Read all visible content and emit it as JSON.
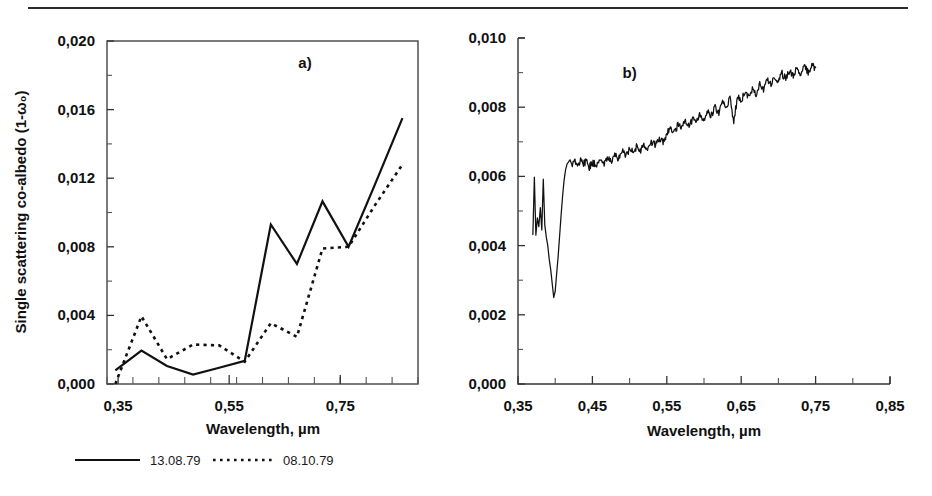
{
  "figure": {
    "panels": [
      "a)",
      "b)"
    ],
    "has_top_rule": true
  },
  "chart_data": [
    {
      "type": "line",
      "panel": "a)",
      "title": "",
      "xlabel": "Wavelength, µm",
      "ylabel": "Single scattering co-albedo (1-ω₀)",
      "xlim": [
        0.33,
        0.89
      ],
      "ylim": [
        0.0,
        0.02
      ],
      "xticks": [
        0.35,
        0.55,
        0.75
      ],
      "xticklabels": [
        "0,35",
        "0,55",
        "0,75"
      ],
      "xminor_step": 0.04667,
      "yticks": [
        0.0,
        0.004,
        0.008,
        0.012,
        0.016,
        0.02
      ],
      "yticklabels": [
        "0,000",
        "0,004",
        "0,008",
        "0,012",
        "0,016",
        "0,020"
      ],
      "yminor_step": 0.002,
      "grid": false,
      "legend_position": "below-left",
      "series": [
        {
          "name": "13.08.79",
          "style": "solid",
          "x": [
            0.345,
            0.392,
            0.438,
            0.485,
            0.532,
            0.578,
            0.625,
            0.672,
            0.718,
            0.765,
            0.812,
            0.862
          ],
          "values": [
            0.0008,
            0.00195,
            0.00105,
            0.00055,
            0.00095,
            0.00135,
            0.0093,
            0.007,
            0.01065,
            0.008,
            0.0116,
            0.0155
          ]
        },
        {
          "name": "08.10.79",
          "style": "dotted",
          "x": [
            0.345,
            0.392,
            0.438,
            0.485,
            0.532,
            0.578,
            0.625,
            0.672,
            0.718,
            0.765,
            0.812,
            0.862
          ],
          "values": [
            0.0,
            0.00395,
            0.00145,
            0.0023,
            0.00225,
            0.0013,
            0.00355,
            0.00275,
            0.0079,
            0.008,
            0.0104,
            0.0128
          ]
        }
      ]
    },
    {
      "type": "line",
      "panel": "b)",
      "title": "",
      "xlabel": "Wavelength, µm",
      "ylabel": "",
      "xlim": [
        0.35,
        0.85
      ],
      "ylim": [
        0.0,
        0.01
      ],
      "xticks": [
        0.35,
        0.45,
        0.55,
        0.65,
        0.75,
        0.85
      ],
      "xticklabels": [
        "0,35",
        "0,45",
        "0,55",
        "0,65",
        "0,75",
        "0,85"
      ],
      "xminor_step": 0.05,
      "yticks": [
        0.0,
        0.002,
        0.004,
        0.006,
        0.008,
        0.01
      ],
      "yticklabels": [
        "0,000",
        "0,002",
        "0,004",
        "0,006",
        "0,008",
        "0,010"
      ],
      "yminor_step": 0.001,
      "grid": false,
      "legend_position": "none",
      "series": [
        {
          "name": "spectrum",
          "style": "solid",
          "x": [
            0.37,
            0.372,
            0.374,
            0.376,
            0.378,
            0.38,
            0.382,
            0.384,
            0.386,
            0.388,
            0.39,
            0.392,
            0.394,
            0.396,
            0.398,
            0.4,
            0.402,
            0.404,
            0.406,
            0.408,
            0.41,
            0.412,
            0.414,
            0.416,
            0.418,
            0.42,
            0.423,
            0.426,
            0.43,
            0.434,
            0.438,
            0.442,
            0.446,
            0.45,
            0.455,
            0.46,
            0.465,
            0.47,
            0.475,
            0.48,
            0.485,
            0.49,
            0.495,
            0.5,
            0.505,
            0.51,
            0.515,
            0.52,
            0.525,
            0.53,
            0.535,
            0.54,
            0.545,
            0.55,
            0.555,
            0.56,
            0.565,
            0.57,
            0.575,
            0.58,
            0.585,
            0.59,
            0.595,
            0.6,
            0.605,
            0.61,
            0.615,
            0.62,
            0.625,
            0.63,
            0.635,
            0.64,
            0.645,
            0.65,
            0.655,
            0.66,
            0.665,
            0.67,
            0.675,
            0.68,
            0.685,
            0.69,
            0.695,
            0.7,
            0.705,
            0.71,
            0.715,
            0.72,
            0.725,
            0.73,
            0.735,
            0.74,
            0.745,
            0.75
          ],
          "values": [
            0.00432,
            0.00598,
            0.0043,
            0.0048,
            0.00455,
            0.0051,
            0.00445,
            0.00592,
            0.0046,
            0.00425,
            0.004,
            0.0036,
            0.0033,
            0.0029,
            0.0025,
            0.00268,
            0.0032,
            0.0037,
            0.0043,
            0.0049,
            0.00545,
            0.0059,
            0.0062,
            0.00636,
            0.00642,
            0.00648,
            0.0063,
            0.00652,
            0.00628,
            0.00645,
            0.00632,
            0.0065,
            0.00628,
            0.0064,
            0.00634,
            0.00648,
            0.00636,
            0.00655,
            0.00642,
            0.00668,
            0.00652,
            0.00672,
            0.0066,
            0.0068,
            0.00668,
            0.00688,
            0.00675,
            0.00692,
            0.0068,
            0.007,
            0.0069,
            0.00712,
            0.00698,
            0.0072,
            0.00742,
            0.00726,
            0.00748,
            0.00735,
            0.0076,
            0.00745,
            0.0077,
            0.00758,
            0.0078,
            0.00765,
            0.00792,
            0.00775,
            0.008,
            0.00785,
            0.00812,
            0.00795,
            0.00826,
            0.00755,
            0.00832,
            0.00818,
            0.00845,
            0.00828,
            0.00856,
            0.0084,
            0.00868,
            0.00852,
            0.0088,
            0.00862,
            0.00888,
            0.0087,
            0.00898,
            0.0088,
            0.00905,
            0.00888,
            0.00912,
            0.00895,
            0.00918,
            0.00902,
            0.0092,
            0.00915
          ]
        }
      ]
    }
  ],
  "legend": {
    "entries": [
      {
        "label": "13.08.79",
        "style": "solid"
      },
      {
        "label": "08.10.79",
        "style": "dotted"
      }
    ]
  }
}
